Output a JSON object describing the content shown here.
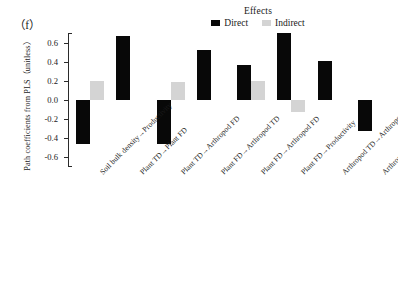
{
  "panel": {
    "tag": "（f）"
  },
  "legend": {
    "title": "Effects",
    "entries": [
      {
        "label": "Direct",
        "color": "#080808"
      },
      {
        "label": "Indirect",
        "color": "#d4d4d4"
      }
    ]
  },
  "axes": {
    "ylabel": "Path coefficients from PLS（unitless）",
    "xlabel": "",
    "yticks": [
      "0.6",
      "0.4",
      "0.2",
      "0.0",
      "-0.2",
      "-0.4",
      "-0.6"
    ],
    "ytick_values": [
      0.6,
      0.4,
      0.2,
      0.0,
      -0.2,
      -0.4,
      -0.6
    ],
    "ylim": [
      -0.7,
      0.7
    ]
  },
  "chart_data": {
    "type": "bar",
    "title": "",
    "subtitle": "",
    "xlabel": "",
    "ylabel": "Path coefficients from PLS（unitless）",
    "ylim": [
      -0.7,
      0.7
    ],
    "yticks": [
      0.6,
      0.4,
      0.2,
      0.0,
      -0.2,
      -0.4,
      -0.6
    ],
    "grid": false,
    "legend_title": "Effects",
    "legend_position": "top-center",
    "categories": [
      "Soil bulk density→Productivity",
      "Plant TD→Plant FD",
      "Plant TD→Arthropod FD",
      "Plant FD→Arthropod TD",
      "Plant FD→Arthropod FD",
      "Plant FD→Productivity",
      "Arthropod TD→Arthropod FD",
      "Arthropod TD→Productivity"
    ],
    "series": [
      {
        "name": "Direct",
        "color": "#080808",
        "values": [
          -0.46,
          0.67,
          -0.46,
          0.52,
          0.37,
          0.7,
          0.41,
          -0.32
        ]
      },
      {
        "name": "Indirect",
        "color": "#d4d4d4",
        "values": [
          0.2,
          null,
          0.19,
          null,
          0.2,
          -0.13,
          null,
          null
        ]
      }
    ]
  }
}
